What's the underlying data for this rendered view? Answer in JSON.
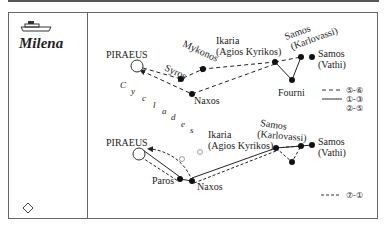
{
  "ship": {
    "name": "Milena",
    "icon": "ship-icon"
  },
  "footer_icon": "diamond-icon",
  "region_label": "Cyclades",
  "top_route": {
    "ports": {
      "piraeus": "PIRAEUS",
      "syros": "Syros",
      "mykonos": "Mykonos",
      "naxos": "Naxos",
      "ikaria_1": "Ikaria",
      "ikaria_2": "(Agios Kyrikos)",
      "samos_k_1": "Samos",
      "samos_k_2": "(Karlovassi)",
      "samos_v_1": "Samos",
      "samos_v_2": "(Vathi)",
      "fourni": "Fourni"
    }
  },
  "bottom_route": {
    "ports": {
      "piraeus": "PIRAEUS",
      "paros": "Paros",
      "naxos": "Naxos",
      "ikaria_1": "Ikaria",
      "ikaria_2": "(Agios Kyrikos)",
      "samos_k_1": "Samos",
      "samos_k_2": "(Karlovassi)",
      "samos_v_1": "Samos",
      "samos_v_2": "(Vathi)"
    }
  },
  "legend": [
    {
      "style": "dashed",
      "label": "⑤-⑥"
    },
    {
      "style": "solid",
      "label": "①-③"
    },
    {
      "style": "none",
      "label": "②-⑤"
    },
    {
      "style": "dotted",
      "label": "⑦-①"
    }
  ]
}
